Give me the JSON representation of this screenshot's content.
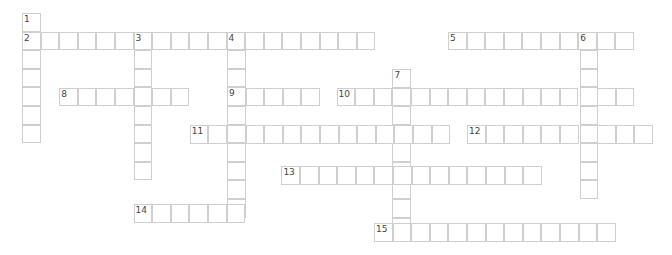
{
  "puzzle": {
    "cell_size": 18.6,
    "border_color": "#cfcfcf",
    "number_color": "#444444",
    "words": [
      {
        "number": "1",
        "direction": "down",
        "x": 22,
        "y": 13,
        "length": 7
      },
      {
        "number": "2",
        "direction": "across",
        "x": 22,
        "y": 31.6,
        "length": 19
      },
      {
        "number": "3",
        "direction": "down",
        "x": 133.6,
        "y": 31.6,
        "length": 8
      },
      {
        "number": "4",
        "direction": "down",
        "x": 227,
        "y": 31.6,
        "length": 10
      },
      {
        "number": "5",
        "direction": "across",
        "x": 448,
        "y": 31.6,
        "length": 10
      },
      {
        "number": "6",
        "direction": "down",
        "x": 579.6,
        "y": 31.6,
        "length": 9
      },
      {
        "number": "7",
        "direction": "down",
        "x": 392.4,
        "y": 69,
        "length": 9
      },
      {
        "number": "8",
        "direction": "across",
        "x": 59.2,
        "y": 87.6,
        "length": 7
      },
      {
        "number": "9",
        "direction": "across",
        "x": 227,
        "y": 87.6,
        "length": 5
      },
      {
        "number": "10",
        "direction": "across",
        "x": 336.6,
        "y": 87.6,
        "length": 16
      },
      {
        "number": "11",
        "direction": "across",
        "x": 189.8,
        "y": 125,
        "length": 14
      },
      {
        "number": "12",
        "direction": "across",
        "x": 467,
        "y": 125,
        "length": 10
      },
      {
        "number": "13",
        "direction": "across",
        "x": 281.4,
        "y": 166,
        "length": 14
      },
      {
        "number": "14",
        "direction": "across",
        "x": 133.6,
        "y": 204,
        "length": 6
      },
      {
        "number": "15",
        "direction": "across",
        "x": 374,
        "y": 223,
        "length": 13
      }
    ]
  }
}
